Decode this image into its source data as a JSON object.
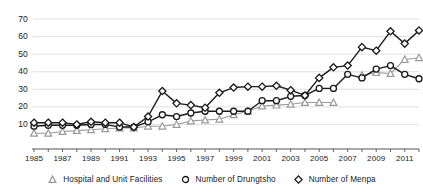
{
  "chart_data": {
    "type": "line",
    "title": "",
    "xlabel": "",
    "ylabel": "",
    "ylim": [
      0,
      74
    ],
    "xlim": [
      1985,
      2012
    ],
    "grid": true,
    "legend_position": "bottom",
    "yticks": [
      10,
      20,
      30,
      40,
      50,
      60,
      70
    ],
    "xticks": [
      1985,
      1987,
      1989,
      1991,
      1993,
      1995,
      1997,
      1999,
      2001,
      2003,
      2005,
      2007,
      2009,
      2011
    ],
    "x": [
      1985,
      1986,
      1987,
      1988,
      1989,
      1990,
      1991,
      1992,
      1993,
      1994,
      1995,
      1996,
      1997,
      1998,
      1999,
      2000,
      2001,
      2002,
      2003,
      2004,
      2005,
      2006,
      2007,
      2008,
      2009,
      2010,
      2011,
      2012
    ],
    "series": [
      {
        "name": "Hospital and Unit Facilities",
        "marker": "triangle",
        "color": "#9a9a9a",
        "values": [
          5,
          5,
          6,
          6.5,
          7,
          7.5,
          8,
          8,
          9,
          9,
          10,
          12,
          12.5,
          13,
          15.5,
          17.5,
          20.5,
          21,
          21.5,
          22.5,
          22.5,
          22.5,
          null,
          38,
          39.5,
          39,
          47,
          48
        ]
      },
      {
        "name": "Number of Drungtsho",
        "marker": "circle",
        "color": "#1a1a1a",
        "values": [
          9,
          9.5,
          9.5,
          9.5,
          10,
          10,
          8.5,
          8.5,
          11.5,
          15.5,
          14.5,
          16.5,
          17.5,
          17.5,
          17.5,
          17.5,
          23.5,
          23.5,
          26,
          26.5,
          30.5,
          30.5,
          38.5,
          36.5,
          41.5,
          43.5,
          38.5,
          36
        ]
      },
      {
        "name": "Number of Menpa",
        "marker": "diamond",
        "color": "#1a1a1a",
        "values": [
          11,
          11,
          11,
          10,
          11.5,
          11,
          11,
          8.5,
          14.5,
          29,
          22,
          21,
          19.5,
          28,
          31,
          31.5,
          31.5,
          32,
          29.5,
          26.5,
          36.5,
          42.5,
          43.5,
          54,
          52,
          63,
          56,
          63.5
        ]
      }
    ]
  },
  "legend": {
    "items": [
      {
        "label": "Hospital and Unit Facilities",
        "marker": "triangle-marker-icon"
      },
      {
        "label": "Number of Drungtsho",
        "marker": "circle-marker-icon"
      },
      {
        "label": "Number of Menpa",
        "marker": "diamond-marker-icon"
      }
    ]
  },
  "axes": {
    "y_tick_labels": [
      "70",
      "60",
      "50",
      "40",
      "30",
      "20",
      "10"
    ],
    "x_tick_labels": [
      "1985",
      "1987",
      "1989",
      "1991",
      "1993",
      "1995",
      "1997",
      "1999",
      "2001",
      "2003",
      "2005",
      "2007",
      "2009",
      "2011"
    ]
  },
  "colors": {
    "grid": "#d8d8d8",
    "axis": "#555555",
    "dark_series": "#1a1a1a",
    "light_series": "#9a9a9a",
    "background": "#ffffff"
  }
}
